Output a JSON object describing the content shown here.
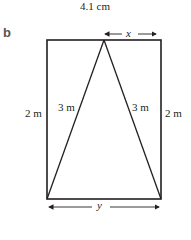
{
  "top_caption": "4.1 cm",
  "part_label": "b",
  "diagram": {
    "shape": "rectangle containing isosceles triangle",
    "labels": {
      "left_side": "2 m",
      "right_side": "2 m",
      "triangle_left": "3 m",
      "triangle_right": "3 m",
      "top_segment": "x",
      "bottom_segment": "y"
    },
    "colors": {
      "stroke": "#231f20"
    }
  }
}
